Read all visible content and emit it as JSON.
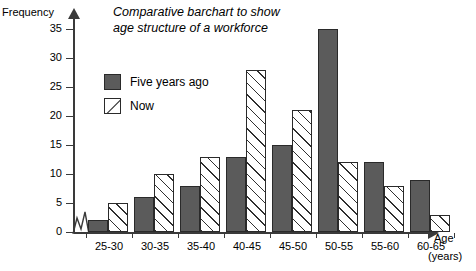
{
  "chart_data": {
    "type": "bar",
    "title": "Comparative barchart to show age structure of a workforce",
    "title_line1": "Comparative barchart to show",
    "title_line2": "age structure of a workforce",
    "xlabel": "Age",
    "xlabel_units": "(years)",
    "ylabel": "Frequency",
    "ylim": [
      0,
      35
    ],
    "ytick_values": [
      0,
      5,
      10,
      15,
      20,
      25,
      30,
      35
    ],
    "ytick_labels": [
      "0",
      "5",
      "10",
      "15",
      "20",
      "25",
      "30",
      "35"
    ],
    "grid": false,
    "legend_position": "upper-left-inside",
    "axis_break": "zigzag at origin on x-axis",
    "categories": [
      "25-30",
      "30-35",
      "35-40",
      "40-45",
      "45-50",
      "50-55",
      "55-60",
      "60-65"
    ],
    "series": [
      {
        "name": "Five years ago",
        "color": "#5b5b5b",
        "fill": "solid-gray",
        "values": [
          2,
          6,
          8,
          13,
          15,
          35,
          12,
          9
        ]
      },
      {
        "name": "Now",
        "color": "#ffffff",
        "fill": "diagonal-hatch",
        "values": [
          5,
          10,
          13,
          28,
          21,
          12,
          8,
          3
        ]
      }
    ]
  },
  "colors": {
    "axis": "#3a3a3a",
    "bar_solid": "#5b5b5b",
    "bar_outline": "#2a2a2a",
    "background": "#ffffff"
  }
}
